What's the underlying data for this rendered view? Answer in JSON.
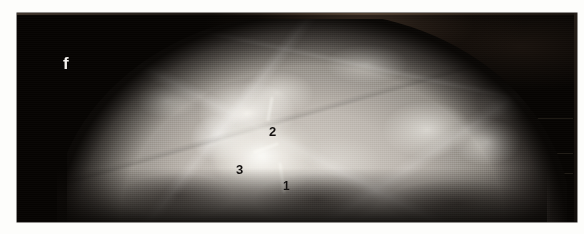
{
  "figure": {
    "panel_letter": "f",
    "modality": "mammogram",
    "caption_present": false
  },
  "annotations": [
    {
      "id": "marker-1",
      "label": "1",
      "x": 266,
      "y": 167
    },
    {
      "id": "marker-2",
      "label": "2",
      "x": 252,
      "y": 112
    },
    {
      "id": "marker-3",
      "label": "3",
      "x": 219,
      "y": 150
    }
  ],
  "markers": {
    "one": "1",
    "two": "2",
    "three": "3"
  },
  "colors": {
    "page_background": "#fdfdfb",
    "film_background": "#060402",
    "tissue_bright": "#fffffc",
    "tissue_mid": "#bdb7b0",
    "tissue_dark": "#3b3633",
    "marker_text": "#141110",
    "panel_letter_text": "#f4f2ee"
  },
  "regions": {
    "film": {
      "x": 17,
      "y": 13,
      "width": 560,
      "height": 209
    },
    "tissue_dome": {
      "x": 50,
      "y": 19,
      "width": 500,
      "height": 205
    },
    "lesion": {
      "x": 196,
      "y": 104,
      "width": 104,
      "height": 78
    }
  }
}
